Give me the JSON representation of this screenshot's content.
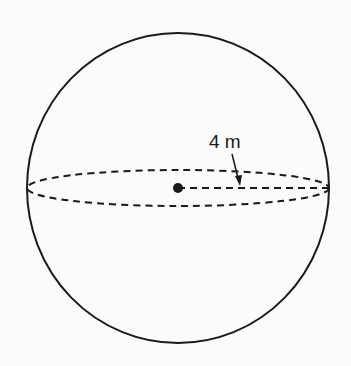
{
  "diagram": {
    "shape": "sphere",
    "radius_label": "4 m",
    "colors": {
      "stroke": "#1a1a1a",
      "background": "#fbfbfa"
    }
  }
}
